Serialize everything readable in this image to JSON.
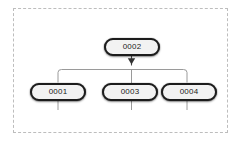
{
  "diagram": {
    "background_color": "#ffffff",
    "group_boundary": {
      "name": "dashed-group-boundary",
      "style": "dashed",
      "color": "#bdbdbd"
    },
    "node_style": {
      "shape": "rounded-pill",
      "border_color": "#1c1c1c",
      "fill_color": "#f2f2f2",
      "text_color": "#1a1a1a"
    },
    "edge_style": {
      "color": "#9a9a9a",
      "arrowhead_color": "#333333"
    },
    "nodes": [
      {
        "id": "0002",
        "label": "0002",
        "role": "parent"
      },
      {
        "id": "0001",
        "label": "0001",
        "role": "child"
      },
      {
        "id": "0003",
        "label": "0003",
        "role": "child"
      },
      {
        "id": "0004",
        "label": "0004",
        "role": "child"
      }
    ],
    "edges": [
      {
        "from": "0002",
        "to": "0001",
        "arrow": true
      },
      {
        "from": "0002",
        "to": "0003",
        "arrow": true
      },
      {
        "from": "0002",
        "to": "0004",
        "arrow": true
      }
    ]
  }
}
